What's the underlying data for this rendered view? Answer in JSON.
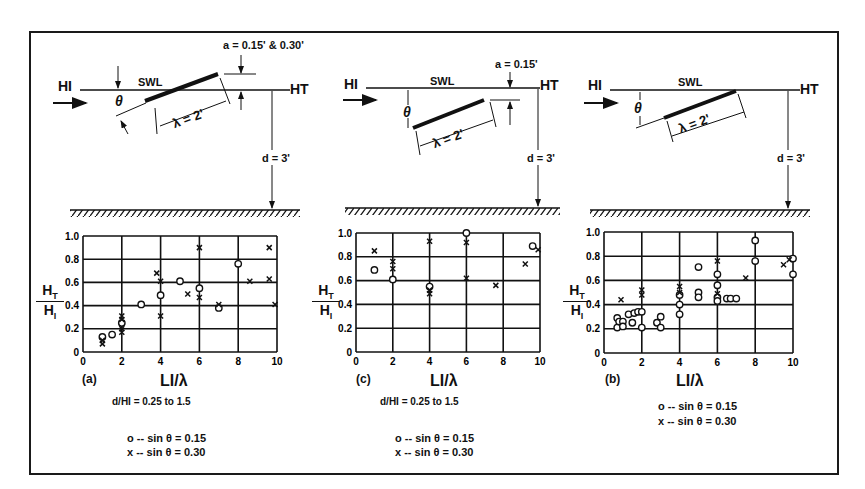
{
  "figure": {
    "panels": [
      {
        "id": "a",
        "schematic": {
          "incident_label": "HI",
          "transmitted_label": "HT",
          "swl_label": "SWL",
          "angle_label": "θ",
          "length_label": "λ = 2'",
          "submergence_label": "a = 0.15' & 0.30'",
          "depth_label": "d = 3'",
          "plate_orientation": "crossing SWL, rising toward wave direction"
        },
        "panel_label": "(a)",
        "condition": "d/HI = 0.25 to 1.5",
        "legend": [
          {
            "marker": "o",
            "text": "o -- sin θ = 0.15"
          },
          {
            "marker": "x",
            "text": "x -- sin θ = 0.30"
          }
        ]
      },
      {
        "id": "c",
        "schematic": {
          "incident_label": "HI",
          "transmitted_label": "HT",
          "swl_label": "SWL",
          "angle_label": "θ",
          "length_label": "λ = 2'",
          "submergence_label": "a = 0.15'",
          "depth_label": "d = 3'",
          "plate_orientation": "fully submerged, rising downstream"
        },
        "panel_label": "(c)",
        "condition": "d/HI = 0.25 to 1.5",
        "legend": [
          {
            "marker": "o",
            "text": "o -- sin θ = 0.15"
          },
          {
            "marker": "x",
            "text": "x -- sin θ = 0.30"
          }
        ]
      },
      {
        "id": "b",
        "schematic": {
          "incident_label": "HI",
          "transmitted_label": "HT",
          "swl_label": "SWL",
          "angle_label": "θ",
          "length_label": "λ = 2'",
          "depth_label": "d = 3'",
          "plate_orientation": "top edge at SWL, sloping down upstream"
        },
        "panel_label": "(b)",
        "legend": [
          {
            "marker": "o",
            "text": "o -- sin θ = 0.15"
          },
          {
            "marker": "x",
            "text": "x -- sin θ = 0.30"
          }
        ]
      }
    ]
  },
  "chart_data": [
    {
      "type": "scatter",
      "title": "(a)",
      "xlabel": "LI/λ",
      "ylabel": "HT/HI",
      "xlim": [
        0,
        10
      ],
      "ylim": [
        0,
        1.0
      ],
      "xticks": [
        "0",
        "2",
        "4",
        "6",
        "8",
        "10"
      ],
      "yticks": [
        "0",
        "0.2",
        "0.4",
        "0.6",
        "0.8",
        "1.0"
      ],
      "grid": true,
      "series": [
        {
          "name": "sin θ = 0.15",
          "marker": "o",
          "x": [
            1.0,
            1.5,
            2.0,
            3.0,
            4.0,
            5.0,
            6.0,
            7.0,
            8.0
          ],
          "y": [
            0.13,
            0.15,
            0.25,
            0.41,
            0.49,
            0.61,
            0.55,
            0.38,
            0.76
          ]
        },
        {
          "name": "sin θ = 0.30",
          "marker": "x",
          "x": [
            1.0,
            1.0,
            2.0,
            2.0,
            2.0,
            2.0,
            3.8,
            4.0,
            4.0,
            5.4,
            6.0,
            6.0,
            7.0,
            8.6,
            9.6,
            9.6,
            9.9
          ],
          "y": [
            0.07,
            0.1,
            0.17,
            0.2,
            0.28,
            0.31,
            0.68,
            0.61,
            0.31,
            0.5,
            0.47,
            0.9,
            0.41,
            0.61,
            0.63,
            0.9,
            0.41
          ]
        }
      ]
    },
    {
      "type": "scatter",
      "title": "(c)",
      "xlabel": "LI/λ",
      "ylabel": "HT/HI",
      "xlim": [
        0,
        10
      ],
      "ylim": [
        0,
        1.0
      ],
      "xticks": [
        "0",
        "2",
        "4",
        "6",
        "8",
        "10"
      ],
      "yticks": [
        "0",
        "0.2",
        "0.4",
        "0.6",
        "0.8",
        "1.0"
      ],
      "grid": true,
      "series": [
        {
          "name": "sin θ = 0.15",
          "marker": "o",
          "x": [
            1.0,
            2.0,
            4.0,
            6.0,
            9.6
          ],
          "y": [
            0.69,
            0.61,
            0.55,
            1.0,
            0.89
          ]
        },
        {
          "name": "sin θ = 0.30",
          "marker": "x",
          "x": [
            1.0,
            2.0,
            2.0,
            4.0,
            4.0,
            4.0,
            6.0,
            6.0,
            7.6,
            9.2,
            9.9
          ],
          "y": [
            0.85,
            0.76,
            0.7,
            0.93,
            0.52,
            0.49,
            0.92,
            0.62,
            0.56,
            0.74,
            0.86
          ]
        }
      ]
    },
    {
      "type": "scatter",
      "title": "(b)",
      "xlabel": "LI/λ",
      "ylabel": "HT/HI",
      "xlim": [
        0,
        10
      ],
      "ylim": [
        0,
        1.0
      ],
      "xticks": [
        "0",
        "2",
        "4",
        "6",
        "8",
        "10"
      ],
      "yticks": [
        "0",
        "0.2",
        "0.4",
        "0.6",
        "0.8",
        "1.0"
      ],
      "grid": true,
      "series": [
        {
          "name": "sin θ = 0.15",
          "marker": "o",
          "x": [
            0.7,
            0.7,
            0.8,
            1.0,
            1.0,
            1.3,
            1.5,
            1.6,
            1.8,
            2.0,
            2.0,
            2.8,
            3.0,
            3.0,
            4.0,
            4.0,
            4.0,
            5.0,
            5.0,
            5.0,
            6.0,
            6.0,
            6.0,
            6.0,
            6.5,
            6.7,
            7.0,
            8.0,
            8.0,
            10.0,
            10.0
          ],
          "y": [
            0.29,
            0.21,
            0.26,
            0.26,
            0.22,
            0.32,
            0.25,
            0.33,
            0.34,
            0.34,
            0.21,
            0.25,
            0.3,
            0.21,
            0.48,
            0.4,
            0.32,
            0.71,
            0.5,
            0.46,
            0.65,
            0.56,
            0.46,
            0.43,
            0.45,
            0.45,
            0.45,
            0.93,
            0.76,
            0.78,
            0.65
          ]
        },
        {
          "name": "sin θ = 0.30",
          "marker": "x",
          "x": [
            0.9,
            2.0,
            2.0,
            4.0,
            4.0,
            6.0,
            6.0,
            7.5,
            9.5,
            9.8
          ],
          "y": [
            0.44,
            0.52,
            0.48,
            0.55,
            0.5,
            0.76,
            0.49,
            0.62,
            0.73,
            0.77
          ]
        }
      ]
    }
  ]
}
